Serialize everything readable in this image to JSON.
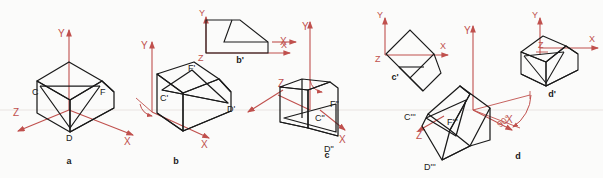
{
  "figure": {
    "background_color": "#fbfbfa",
    "solid_line_color": "#1a1a1a",
    "axis_color": "#c0504d",
    "guide_color": "#e8e3e0",
    "ground_line_y": 110
  },
  "axis_labels": {
    "x": "X",
    "y": "Y",
    "z": "Z"
  },
  "captions": {
    "a": "a",
    "b": "b",
    "c": "c",
    "d": "d",
    "b_aux": "b'",
    "c_aux": "c'",
    "d_aux": "d'"
  },
  "vertex_labels": {
    "view_a": {
      "c": "C",
      "d": "D",
      "f": "F"
    },
    "view_b": {
      "c": "C'",
      "d": "D'",
      "f": "F'"
    },
    "view_c": {
      "c": "C\"",
      "d": "D\"",
      "f": "F\""
    },
    "view_d": {
      "c": "C'''",
      "d": "D'''",
      "f": "F'''"
    }
  },
  "annotations": {
    "right_angle": "90°"
  },
  "views": [
    {
      "id": "a",
      "caption": "a",
      "kind": "isometric-solid",
      "axes": [
        "Y",
        "X",
        "Z"
      ],
      "vertices_shown": [
        "C",
        "D",
        "F"
      ],
      "has_rotation_arc": false
    },
    {
      "id": "b",
      "caption": "b",
      "kind": "isometric-solid-rotated",
      "axes": [
        "Y",
        "X",
        "Z"
      ],
      "vertices_shown": [
        "C'",
        "D'",
        "F'"
      ],
      "has_rotation_arc": true,
      "aux_view": {
        "caption": "b'",
        "kind": "orthographic-projection",
        "axes": [
          "Y",
          "X",
          "Z"
        ]
      }
    },
    {
      "id": "c",
      "caption": "c",
      "kind": "isometric-solid-rotated",
      "axes": [
        "Y",
        "X",
        "Z"
      ],
      "vertices_shown": [
        "C\"",
        "D\"",
        "F\""
      ],
      "has_rotation_arc": true,
      "aux_view": {
        "caption": "c'",
        "kind": "orthographic-projection-tilted",
        "axes": [
          "Y",
          "X",
          "Z"
        ]
      }
    },
    {
      "id": "d",
      "caption": "d",
      "kind": "isometric-solid-rotated",
      "axes": [
        "Y",
        "X",
        "Z"
      ],
      "vertices_shown": [
        "C'''",
        "D'''",
        "F'''"
      ],
      "has_rotation_arc": true,
      "annotation": "90°",
      "aux_view": {
        "caption": "d'",
        "kind": "isometric-projection",
        "axes": [
          "Y",
          "X",
          "Z"
        ]
      }
    }
  ]
}
